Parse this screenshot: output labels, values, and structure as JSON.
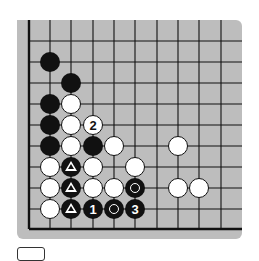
{
  "board": {
    "background": "#bdbdbd",
    "line_color": "#111111",
    "columns_x": [
      29,
      50,
      71,
      93,
      114,
      135,
      157,
      178,
      199,
      221
    ],
    "rows_y": [
      41,
      62,
      83,
      104,
      125,
      146,
      167,
      188,
      209,
      229
    ],
    "left_edge": true,
    "bottom_edge": true,
    "top_edge": false,
    "right_edge": false
  },
  "stones": [
    {
      "color": "black",
      "col": 1,
      "row": 1
    },
    {
      "color": "black",
      "col": 2,
      "row": 2
    },
    {
      "color": "black",
      "col": 1,
      "row": 3
    },
    {
      "color": "white",
      "col": 2,
      "row": 3
    },
    {
      "color": "black",
      "col": 1,
      "row": 4
    },
    {
      "color": "white",
      "col": 2,
      "row": 4
    },
    {
      "color": "white",
      "col": 3,
      "row": 4,
      "label": "2"
    },
    {
      "color": "black",
      "col": 1,
      "row": 5
    },
    {
      "color": "white",
      "col": 2,
      "row": 5
    },
    {
      "color": "black",
      "col": 3,
      "row": 5
    },
    {
      "color": "white",
      "col": 4,
      "row": 5
    },
    {
      "color": "white",
      "col": 7,
      "row": 5
    },
    {
      "color": "white",
      "col": 1,
      "row": 6
    },
    {
      "color": "black",
      "col": 2,
      "row": 6,
      "mark": "triangle"
    },
    {
      "color": "white",
      "col": 3,
      "row": 6
    },
    {
      "color": "white",
      "col": 5,
      "row": 6
    },
    {
      "color": "white",
      "col": 1,
      "row": 7
    },
    {
      "color": "black",
      "col": 2,
      "row": 7,
      "mark": "triangle"
    },
    {
      "color": "white",
      "col": 3,
      "row": 7
    },
    {
      "color": "white",
      "col": 4,
      "row": 7
    },
    {
      "color": "black",
      "col": 5,
      "row": 7,
      "mark": "circle"
    },
    {
      "color": "white",
      "col": 7,
      "row": 7
    },
    {
      "color": "white",
      "col": 8,
      "row": 7
    },
    {
      "color": "white",
      "col": 1,
      "row": 8
    },
    {
      "color": "black",
      "col": 2,
      "row": 8,
      "mark": "triangle"
    },
    {
      "color": "black",
      "col": 3,
      "row": 8,
      "label": "1"
    },
    {
      "color": "black",
      "col": 4,
      "row": 8,
      "mark": "circle"
    },
    {
      "color": "black",
      "col": 5,
      "row": 8,
      "label": "3"
    }
  ],
  "caption_box": {
    "text": ""
  }
}
